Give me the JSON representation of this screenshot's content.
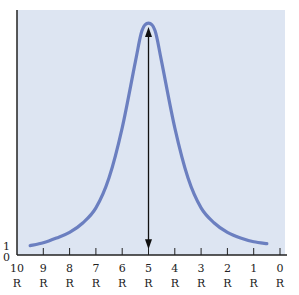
{
  "chart_data": {
    "type": "line",
    "title": "",
    "xlabel": "",
    "ylabel": "",
    "x_ticks": [
      {
        "value": 10,
        "line1": "10",
        "line2": "R"
      },
      {
        "value": 9,
        "line1": "9",
        "line2": "R"
      },
      {
        "value": 8,
        "line1": "8",
        "line2": "R"
      },
      {
        "value": 7,
        "line1": "7",
        "line2": "R"
      },
      {
        "value": 6,
        "line1": "6",
        "line2": "R"
      },
      {
        "value": 5,
        "line1": "5",
        "line2": "R"
      },
      {
        "value": 4,
        "line1": "4",
        "line2": "R"
      },
      {
        "value": 3,
        "line1": "3",
        "line2": "R"
      },
      {
        "value": 2,
        "line1": "2",
        "line2": "R"
      },
      {
        "value": 1,
        "line1": "1",
        "line2": "R"
      },
      {
        "value": 0,
        "line1": "0",
        "line2": "R"
      }
    ],
    "y_ticks": [
      {
        "value": 0,
        "label": "0"
      },
      {
        "value": 1,
        "label": "1"
      }
    ],
    "xlim": [
      10,
      0
    ],
    "ylim": [
      0,
      26
    ],
    "grid": false,
    "legend": "none",
    "series": [
      {
        "name": "curve",
        "color": "#6b7fc0",
        "points": [
          [
            9.5,
            1.0
          ],
          [
            9.0,
            1.3
          ],
          [
            8.5,
            1.8
          ],
          [
            8.0,
            2.4
          ],
          [
            7.5,
            3.4
          ],
          [
            7.0,
            5.0
          ],
          [
            6.5,
            8.2
          ],
          [
            6.0,
            13.5
          ],
          [
            5.5,
            20.5
          ],
          [
            5.25,
            23.8
          ],
          [
            5.0,
            24.6
          ],
          [
            4.75,
            23.8
          ],
          [
            4.5,
            20.5
          ],
          [
            4.0,
            13.5
          ],
          [
            3.5,
            8.2
          ],
          [
            3.0,
            5.0
          ],
          [
            2.5,
            3.4
          ],
          [
            2.0,
            2.4
          ],
          [
            1.5,
            1.8
          ],
          [
            1.0,
            1.4
          ],
          [
            0.5,
            1.2
          ]
        ]
      }
    ],
    "annotations": [
      {
        "type": "double-arrow",
        "x": 5,
        "y_from": 0.6,
        "y_to": 24.2,
        "color": "#111111"
      }
    ],
    "colors": {
      "plot_background": "#dde5f2",
      "axis": "#222222"
    }
  }
}
